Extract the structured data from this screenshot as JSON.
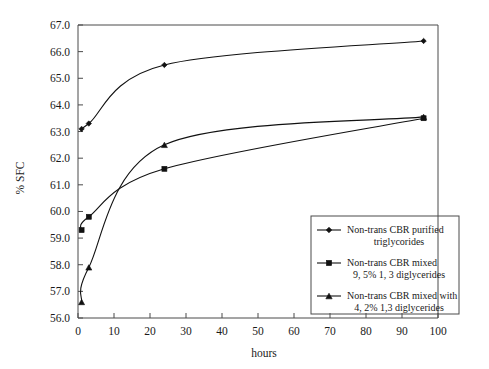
{
  "chart_data": {
    "type": "line",
    "title": "",
    "subtitle": "",
    "xlabel": "hours",
    "ylabel": "% SFC",
    "xlim": [
      0,
      100
    ],
    "ylim": [
      56.0,
      67.0
    ],
    "xticks": [
      0,
      10,
      20,
      30,
      40,
      50,
      60,
      70,
      80,
      90,
      100
    ],
    "xtick_labels": [
      "0",
      "10",
      "20",
      "30",
      "40",
      "50",
      "60",
      "70",
      "80",
      "90",
      "100"
    ],
    "yticks": [
      56.0,
      57.0,
      58.0,
      59.0,
      60.0,
      61.0,
      62.0,
      63.0,
      64.0,
      65.0,
      66.0,
      67.0
    ],
    "ytick_labels": [
      "56.0",
      "57.0",
      "58.0",
      "59.0",
      "60.0",
      "61.0",
      "62.0",
      "63.0",
      "64.0",
      "65.0",
      "66.0",
      "67.0"
    ],
    "grid": false,
    "legend_position": "lower-right-inside",
    "series": [
      {
        "name": "Non-trans CBR purified triglycorides",
        "marker": "diamond",
        "color": "#111111",
        "x": [
          1,
          3,
          24,
          96
        ],
        "y": [
          63.1,
          63.3,
          65.5,
          66.4
        ]
      },
      {
        "name": "Non-trans CBR mixed 9, 5% 1, 3 diglycerides",
        "marker": "square",
        "color": "#111111",
        "x": [
          1,
          3,
          24,
          96
        ],
        "y": [
          59.3,
          59.8,
          61.6,
          63.5
        ]
      },
      {
        "name": "Non-trans CBR mixed with 4, 2% 1,3 diglycerides",
        "marker": "triangle",
        "color": "#111111",
        "x": [
          1,
          3,
          24,
          96
        ],
        "y": [
          56.6,
          57.9,
          62.5,
          63.55
        ]
      }
    ]
  },
  "axes": {
    "y_title": "% SFC",
    "x_title": "hours"
  },
  "legend": {
    "entries": [
      {
        "marker": "diamond",
        "line1": "Non-trans CBR purified",
        "line2": "triglycorides"
      },
      {
        "marker": "square",
        "line1": "Non-trans CBR mixed",
        "line2": "9, 5% 1, 3 diglycerides"
      },
      {
        "marker": "triangle",
        "line1": "Non-trans CBR mixed with",
        "line2": "4, 2% 1,3 diglycerides"
      }
    ]
  },
  "colors": {
    "line": "#111111",
    "axis": "#4a4a4a",
    "background": "#ffffff",
    "text": "#1a1a1a"
  }
}
